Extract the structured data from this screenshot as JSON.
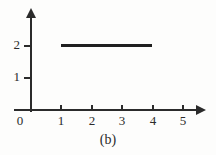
{
  "figure": {
    "caption": "(b)",
    "background_color": "#fdfdfc",
    "ink_color": "#2b2b2b"
  },
  "chart_data": {
    "type": "line",
    "title": "",
    "xlabel": "",
    "ylabel": "",
    "xlim": [
      0,
      5.6
    ],
    "ylim": [
      0,
      2.9
    ],
    "grid": false,
    "legend": null,
    "x_ticks": [
      1,
      2,
      3,
      4,
      5
    ],
    "x_tick_labels": [
      "1",
      "2",
      "3",
      "4",
      "5"
    ],
    "y_ticks": [
      1,
      2
    ],
    "y_tick_labels": [
      "1",
      "2"
    ],
    "origin_label": "0",
    "series": [
      {
        "name": "constant-segment",
        "x": [
          1,
          4
        ],
        "values": [
          2,
          2
        ],
        "color": "#1f1f1f",
        "style": "solid",
        "width": 3
      }
    ],
    "annotations": [
      "(b)"
    ]
  }
}
